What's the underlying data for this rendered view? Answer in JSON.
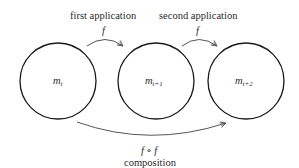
{
  "nodes": [
    {
      "id": "m_t",
      "base": "m",
      "subscript": "t",
      "cx": 58,
      "cy": 81,
      "r": 38
    },
    {
      "id": "m_t+1",
      "base": "m",
      "subscript": "t+1",
      "cx": 156,
      "cy": 81,
      "r": 38
    },
    {
      "id": "m_t+2",
      "base": "m",
      "subscript": "t+2",
      "cx": 246,
      "cy": 81,
      "r": 38
    }
  ],
  "edges": [
    {
      "id": "first",
      "from": "m_t",
      "to": "m_t+1",
      "caption": "first application",
      "symbol": "f"
    },
    {
      "id": "second",
      "from": "m_t+1",
      "to": "m_t+2",
      "caption": "second application",
      "symbol": "f"
    },
    {
      "id": "composition",
      "from": "m_t",
      "to": "m_t+2",
      "caption": "composition",
      "symbol": "f ∘ f"
    }
  ],
  "colors": {
    "stroke": "#1a1a1a",
    "arrow": "#555555",
    "text": "#2b2b2b"
  }
}
